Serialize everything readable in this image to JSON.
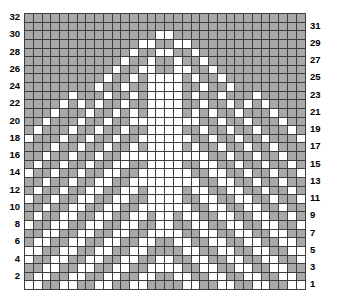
{
  "chart_data": {
    "type": "heatmap",
    "title": "",
    "xlabel": "",
    "ylabel": "",
    "columns": 32,
    "rows": 32,
    "grid_legend": {
      "filled_value": 1,
      "empty_value": 0,
      "filled_color": "#a8a8a8",
      "empty_color": "#ffffff",
      "gridline_color": "#3d3d3d",
      "border_color": "#1a1a1a"
    },
    "row_labels_left": [
      "32",
      "30",
      "28",
      "26",
      "24",
      "22",
      "20",
      "18",
      "16",
      "14",
      "12",
      "10",
      "8",
      "6",
      "4",
      "2"
    ],
    "row_labels_right": [
      "31",
      "29",
      "27",
      "25",
      "23",
      "21",
      "19",
      "17",
      "15",
      "13",
      "11",
      "9",
      "7",
      "5",
      "3",
      "1"
    ],
    "row_label_side_left_parity": "even",
    "row_label_side_right_parity": "odd",
    "row_order": "top row is 32, bottom row is 1",
    "symmetry": "mirror-symmetric left to right",
    "matrix": [
      [
        1,
        1,
        1,
        1,
        1,
        1,
        1,
        1,
        1,
        1,
        1,
        1,
        1,
        1,
        1,
        1,
        1,
        1,
        1,
        1,
        1,
        1,
        1,
        1,
        1,
        1,
        1,
        1,
        1,
        1,
        1,
        1
      ],
      [
        1,
        1,
        1,
        1,
        1,
        1,
        1,
        1,
        1,
        1,
        1,
        1,
        1,
        1,
        1,
        1,
        1,
        1,
        1,
        1,
        1,
        1,
        1,
        1,
        1,
        1,
        1,
        1,
        1,
        1,
        1,
        1
      ],
      [
        1,
        1,
        1,
        1,
        1,
        1,
        1,
        1,
        1,
        1,
        1,
        1,
        1,
        1,
        1,
        0,
        0,
        1,
        1,
        1,
        1,
        1,
        1,
        1,
        1,
        1,
        1,
        1,
        1,
        1,
        1,
        1
      ],
      [
        1,
        1,
        1,
        1,
        1,
        1,
        1,
        1,
        1,
        1,
        1,
        1,
        1,
        0,
        0,
        1,
        1,
        0,
        0,
        1,
        1,
        1,
        1,
        1,
        1,
        1,
        1,
        1,
        1,
        1,
        1,
        1
      ],
      [
        1,
        1,
        1,
        1,
        1,
        1,
        1,
        1,
        1,
        1,
        1,
        1,
        0,
        1,
        1,
        0,
        0,
        1,
        1,
        0,
        1,
        1,
        1,
        1,
        1,
        1,
        1,
        1,
        1,
        1,
        1,
        1
      ],
      [
        1,
        1,
        1,
        1,
        1,
        1,
        1,
        1,
        1,
        1,
        1,
        0,
        1,
        1,
        0,
        1,
        1,
        0,
        1,
        1,
        0,
        1,
        1,
        1,
        1,
        1,
        1,
        1,
        1,
        1,
        1,
        1
      ],
      [
        1,
        1,
        1,
        1,
        1,
        1,
        1,
        1,
        1,
        1,
        0,
        1,
        1,
        0,
        0,
        1,
        1,
        0,
        0,
        1,
        1,
        0,
        1,
        1,
        1,
        1,
        1,
        1,
        1,
        1,
        1,
        1
      ],
      [
        1,
        1,
        1,
        1,
        1,
        1,
        1,
        1,
        1,
        0,
        1,
        1,
        0,
        1,
        0,
        0,
        0,
        0,
        1,
        0,
        1,
        1,
        0,
        1,
        1,
        1,
        1,
        1,
        1,
        1,
        1,
        1
      ],
      [
        1,
        1,
        1,
        1,
        1,
        1,
        1,
        1,
        0,
        1,
        1,
        0,
        1,
        1,
        0,
        0,
        0,
        0,
        1,
        1,
        0,
        1,
        1,
        0,
        1,
        1,
        1,
        1,
        1,
        1,
        1,
        1
      ],
      [
        1,
        1,
        1,
        1,
        1,
        0,
        1,
        1,
        1,
        0,
        1,
        1,
        0,
        1,
        0,
        0,
        0,
        0,
        1,
        0,
        1,
        1,
        0,
        1,
        1,
        1,
        0,
        1,
        1,
        1,
        1,
        1
      ],
      [
        1,
        1,
        1,
        1,
        0,
        1,
        0,
        1,
        0,
        1,
        1,
        0,
        1,
        1,
        0,
        0,
        0,
        0,
        1,
        1,
        0,
        1,
        1,
        0,
        1,
        0,
        1,
        0,
        1,
        1,
        1,
        1
      ],
      [
        1,
        1,
        1,
        0,
        1,
        1,
        1,
        0,
        1,
        1,
        0,
        1,
        0,
        1,
        0,
        0,
        0,
        0,
        1,
        0,
        1,
        0,
        1,
        1,
        0,
        1,
        1,
        1,
        0,
        1,
        1,
        1
      ],
      [
        1,
        1,
        0,
        1,
        1,
        1,
        0,
        1,
        1,
        0,
        1,
        1,
        0,
        0,
        0,
        0,
        0,
        0,
        0,
        0,
        1,
        1,
        0,
        1,
        1,
        0,
        1,
        1,
        1,
        0,
        1,
        1
      ],
      [
        1,
        0,
        1,
        1,
        1,
        0,
        1,
        1,
        0,
        1,
        1,
        0,
        1,
        1,
        0,
        0,
        0,
        0,
        1,
        1,
        0,
        1,
        1,
        0,
        1,
        1,
        0,
        1,
        1,
        1,
        0,
        1
      ],
      [
        0,
        1,
        1,
        1,
        0,
        1,
        1,
        0,
        1,
        1,
        0,
        1,
        1,
        0,
        0,
        0,
        0,
        0,
        0,
        1,
        1,
        0,
        1,
        1,
        0,
        1,
        1,
        0,
        1,
        1,
        1,
        0
      ],
      [
        1,
        1,
        1,
        0,
        1,
        1,
        0,
        1,
        1,
        0,
        1,
        1,
        0,
        1,
        0,
        0,
        0,
        0,
        1,
        0,
        1,
        1,
        0,
        1,
        1,
        0,
        1,
        1,
        0,
        1,
        1,
        1
      ],
      [
        1,
        1,
        0,
        1,
        1,
        0,
        1,
        1,
        0,
        1,
        1,
        0,
        0,
        0,
        0,
        0,
        0,
        0,
        0,
        0,
        0,
        1,
        1,
        0,
        1,
        1,
        0,
        1,
        1,
        0,
        1,
        1
      ],
      [
        1,
        0,
        1,
        1,
        0,
        1,
        1,
        0,
        1,
        1,
        0,
        0,
        1,
        1,
        0,
        0,
        0,
        0,
        1,
        1,
        0,
        0,
        1,
        1,
        0,
        1,
        1,
        0,
        1,
        1,
        0,
        1
      ],
      [
        0,
        1,
        1,
        0,
        1,
        1,
        0,
        1,
        1,
        0,
        0,
        1,
        1,
        0,
        0,
        0,
        0,
        0,
        0,
        1,
        1,
        0,
        0,
        1,
        1,
        0,
        1,
        1,
        0,
        1,
        1,
        0
      ],
      [
        1,
        1,
        0,
        1,
        1,
        0,
        1,
        1,
        0,
        0,
        1,
        1,
        0,
        0,
        0,
        0,
        0,
        0,
        0,
        0,
        1,
        1,
        0,
        0,
        1,
        1,
        0,
        1,
        1,
        0,
        1,
        1
      ],
      [
        1,
        0,
        1,
        1,
        0,
        1,
        1,
        0,
        0,
        1,
        1,
        0,
        0,
        1,
        0,
        0,
        0,
        0,
        1,
        0,
        0,
        1,
        1,
        0,
        0,
        1,
        1,
        0,
        1,
        1,
        0,
        1
      ],
      [
        0,
        1,
        1,
        0,
        1,
        1,
        0,
        0,
        1,
        1,
        0,
        0,
        1,
        1,
        0,
        0,
        0,
        0,
        1,
        1,
        0,
        0,
        1,
        1,
        0,
        0,
        1,
        1,
        0,
        1,
        1,
        0
      ],
      [
        1,
        1,
        0,
        1,
        1,
        0,
        0,
        1,
        1,
        0,
        0,
        1,
        1,
        0,
        0,
        0,
        0,
        0,
        0,
        1,
        1,
        0,
        0,
        1,
        1,
        0,
        0,
        1,
        1,
        0,
        1,
        1
      ],
      [
        1,
        0,
        1,
        1,
        0,
        0,
        1,
        1,
        0,
        0,
        1,
        1,
        0,
        0,
        1,
        0,
        0,
        1,
        0,
        0,
        1,
        1,
        0,
        0,
        1,
        1,
        0,
        0,
        1,
        1,
        0,
        1
      ],
      [
        0,
        1,
        1,
        0,
        0,
        1,
        1,
        0,
        0,
        1,
        1,
        0,
        0,
        1,
        1,
        0,
        0,
        1,
        1,
        0,
        0,
        1,
        1,
        0,
        0,
        1,
        1,
        0,
        0,
        1,
        1,
        0
      ],
      [
        1,
        1,
        0,
        0,
        1,
        1,
        0,
        0,
        1,
        1,
        0,
        0,
        1,
        1,
        0,
        0,
        0,
        0,
        1,
        1,
        0,
        0,
        1,
        1,
        0,
        0,
        1,
        1,
        0,
        0,
        1,
        1
      ],
      [
        1,
        0,
        0,
        1,
        1,
        0,
        0,
        1,
        1,
        0,
        0,
        1,
        1,
        0,
        0,
        1,
        1,
        0,
        0,
        1,
        1,
        0,
        0,
        1,
        1,
        0,
        0,
        1,
        1,
        0,
        0,
        1
      ],
      [
        0,
        0,
        1,
        1,
        0,
        0,
        1,
        1,
        0,
        0,
        1,
        1,
        0,
        0,
        1,
        1,
        1,
        1,
        0,
        0,
        1,
        1,
        0,
        0,
        1,
        1,
        0,
        0,
        1,
        1,
        0,
        0
      ],
      [
        0,
        1,
        1,
        0,
        0,
        1,
        1,
        0,
        0,
        1,
        1,
        0,
        0,
        1,
        1,
        0,
        0,
        1,
        1,
        0,
        0,
        1,
        1,
        0,
        0,
        1,
        1,
        0,
        0,
        1,
        1,
        0
      ],
      [
        1,
        1,
        0,
        0,
        1,
        1,
        0,
        0,
        1,
        1,
        0,
        0,
        1,
        1,
        0,
        0,
        0,
        0,
        1,
        1,
        0,
        0,
        1,
        1,
        0,
        0,
        1,
        1,
        0,
        0,
        1,
        1
      ],
      [
        1,
        0,
        0,
        1,
        1,
        0,
        0,
        1,
        1,
        0,
        0,
        1,
        1,
        0,
        0,
        1,
        1,
        0,
        0,
        1,
        1,
        0,
        0,
        1,
        1,
        0,
        0,
        1,
        1,
        0,
        0,
        1
      ],
      [
        0,
        0,
        1,
        1,
        0,
        0,
        1,
        1,
        0,
        0,
        1,
        1,
        0,
        0,
        1,
        1,
        1,
        1,
        0,
        0,
        1,
        1,
        0,
        0,
        1,
        1,
        0,
        0,
        1,
        1,
        0,
        0
      ]
    ]
  }
}
